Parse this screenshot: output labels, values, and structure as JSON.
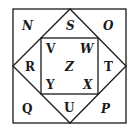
{
  "diagram": {
    "type": "nested-squares-with-diamond",
    "colors": {
      "stroke": "#1a1a1a",
      "background": "#ffffff",
      "text": "#1a1a1a"
    },
    "outer_square": {
      "x": 13,
      "y": 9,
      "w": 113,
      "h": 114
    },
    "diamond": {
      "top": [
        70,
        9
      ],
      "right": [
        126,
        66
      ],
      "bottom": [
        70,
        123
      ],
      "left": [
        13,
        66
      ]
    },
    "inner_square": {
      "x": 41,
      "y": 38,
      "w": 57,
      "h": 56
    },
    "labels": {
      "N": "N",
      "S": "S",
      "O": "O",
      "R": "R",
      "T": "T",
      "Q": "Q",
      "U": "U",
      "P": "P",
      "V": "V",
      "W": "W",
      "Z": "Z",
      "Y": "Y",
      "X": "X"
    },
    "regions": [
      {
        "label": "N",
        "region": "outer top-left corner"
      },
      {
        "label": "S",
        "region": "diamond top triangle"
      },
      {
        "label": "O",
        "region": "outer top-right corner"
      },
      {
        "label": "R",
        "region": "diamond left triangle"
      },
      {
        "label": "T",
        "region": "diamond right triangle"
      },
      {
        "label": "Q",
        "region": "outer bottom-left corner"
      },
      {
        "label": "U",
        "region": "diamond bottom triangle"
      },
      {
        "label": "P",
        "region": "outer bottom-right corner"
      },
      {
        "label": "V",
        "region": "inner square top-left"
      },
      {
        "label": "W",
        "region": "inner square top-right"
      },
      {
        "label": "Z",
        "region": "inner square center"
      },
      {
        "label": "Y",
        "region": "inner square bottom-left"
      },
      {
        "label": "X",
        "region": "inner square bottom-right"
      }
    ]
  }
}
